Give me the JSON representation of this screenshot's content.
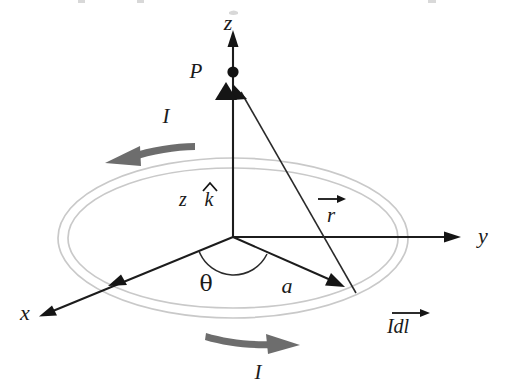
{
  "figure": {
    "type": "physics-vector-diagram",
    "background_color": "#ffffff"
  },
  "colors": {
    "ink": "#1a1a1a",
    "axis": "#1c1c1c",
    "ring": "#c9c9c9",
    "current_arrow": "#6d6d6d",
    "point_dot": "#121212"
  },
  "axes": {
    "x": {
      "label": "x",
      "x": 25,
      "y": 320
    },
    "y": {
      "label": "y",
      "x": 478,
      "y": 243
    },
    "z": {
      "label": "z",
      "x": 228,
      "y": 30
    }
  },
  "labels": {
    "point_p": "P",
    "theta": "θ",
    "radius": "a",
    "r_vector": "r",
    "unit_vector": "k",
    "z_coordinate": "z",
    "current_top": "I",
    "current_bottom": "I",
    "current_element": "Idl"
  },
  "annotations": [
    {
      "name": "field-point",
      "text": "P",
      "x": 196,
      "y": 78
    },
    {
      "name": "current-upper",
      "text": "I",
      "x": 166,
      "y": 123
    },
    {
      "name": "current-lower",
      "text": "I",
      "x": 258,
      "y": 379
    },
    {
      "name": "z-unit-vector",
      "text": "z k",
      "x": 183,
      "y": 205
    },
    {
      "name": "polar-angle",
      "text": "θ",
      "x": 206,
      "y": 291
    },
    {
      "name": "loop-radius",
      "text": "a",
      "x": 287,
      "y": 292
    },
    {
      "name": "displacement-vector",
      "text": "r",
      "x": 327,
      "y": 213
    },
    {
      "name": "current-element",
      "text": "Idl",
      "x": 398,
      "y": 329
    }
  ],
  "geometry": {
    "origin": {
      "x": 233,
      "y": 237
    },
    "loop": {
      "center_x": 233,
      "center_y": 238,
      "outer_rx": 175,
      "outer_ry": 80,
      "inner_rx": 165,
      "inner_ry": 70
    },
    "point_p": {
      "x": 233,
      "y": 72
    },
    "source_point": {
      "x": 355,
      "y": 292
    },
    "radius_arrow_tip": {
      "x": 340,
      "y": 285
    },
    "theta_arc_radius": 36
  }
}
